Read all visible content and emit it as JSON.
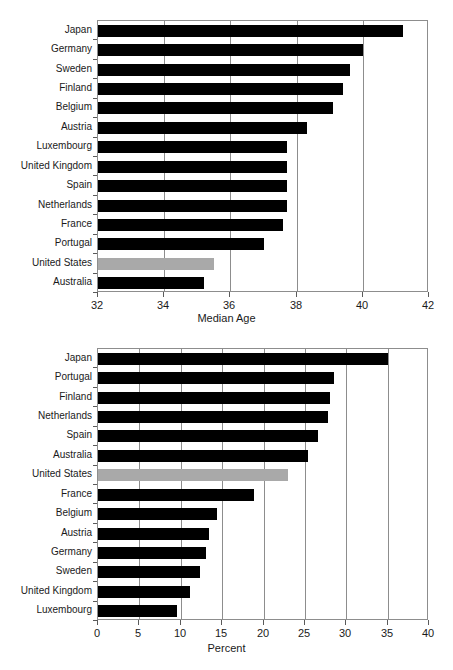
{
  "figure": {
    "background": "#ffffff",
    "bar_color": "#000000",
    "highlight_color": "#a9a9a9",
    "axis_color": "#8d8d8d"
  },
  "chart_data": [
    {
      "id": "median-age",
      "type": "bar",
      "orientation": "horizontal",
      "title": "",
      "xlabel": "Median Age",
      "ylabel": "",
      "xlim": [
        32,
        42
      ],
      "xticks": [
        32,
        34,
        36,
        38,
        40,
        42
      ],
      "xtick_labels": [
        "32",
        "34",
        "36",
        "38",
        "40",
        "42"
      ],
      "grid": true,
      "grid_axis": "x",
      "legend": "none",
      "highlight_category": "United States",
      "categories": [
        "Japan",
        "Germany",
        "Sweden",
        "Finland",
        "Belgium",
        "Austria",
        "Luxembourg",
        "United Kingdom",
        "Spain",
        "Netherlands",
        "France",
        "Portugal",
        "United States",
        "Australia"
      ],
      "values": [
        41.2,
        40.0,
        39.6,
        39.4,
        39.1,
        38.3,
        37.7,
        37.7,
        37.7,
        37.7,
        37.6,
        37.0,
        35.5,
        35.2
      ]
    },
    {
      "id": "percent",
      "type": "bar",
      "orientation": "horizontal",
      "title": "",
      "xlabel": "Percent",
      "ylabel": "",
      "xlim": [
        0,
        40
      ],
      "xticks": [
        0,
        5,
        10,
        15,
        20,
        25,
        30,
        35,
        40
      ],
      "xtick_labels": [
        "0",
        "5",
        "10",
        "15",
        "20",
        "25",
        "30",
        "35",
        "40"
      ],
      "grid": true,
      "grid_axis": "x",
      "legend": "none",
      "highlight_category": "United States",
      "categories": [
        "Japan",
        "Portugal",
        "Finland",
        "Netherlands",
        "Spain",
        "Australia",
        "United States",
        "France",
        "Belgium",
        "Austria",
        "Germany",
        "Sweden",
        "United Kingdom",
        "Luxembourg"
      ],
      "values": [
        35.1,
        28.5,
        28.0,
        27.8,
        26.6,
        25.4,
        23.0,
        18.8,
        14.4,
        13.4,
        13.1,
        12.3,
        11.1,
        9.5
      ]
    }
  ]
}
